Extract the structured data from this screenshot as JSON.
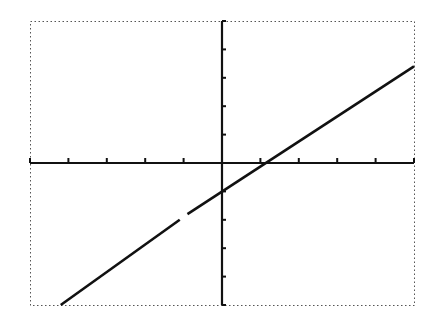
{
  "screen": {
    "type": "graphing-calculator-plot",
    "background": "#ffffff",
    "ink": "#111111",
    "border_style": "dotted"
  },
  "chart_data": {
    "type": "line",
    "title": "",
    "xlabel": "",
    "ylabel": "",
    "xlim": [
      -5,
      5
    ],
    "ylim": [
      -5,
      5
    ],
    "x_ticks": [
      -5,
      -4,
      -3,
      -2,
      -1,
      0,
      1,
      2,
      3,
      4,
      5
    ],
    "y_ticks": [
      -5,
      -4,
      -3,
      -2,
      -1,
      0,
      1,
      2,
      3,
      4,
      5
    ],
    "tick_labels_shown": false,
    "grid": false,
    "legend": null,
    "series": [
      {
        "name": "y = 0.9x - 1",
        "x": [
          -4.2,
          -1.1,
          -0.9,
          5
        ],
        "y": [
          -5,
          -2,
          -1.8,
          3.4
        ],
        "note": "straight line with slope ~0.9, y-intercept -1, x-intercept ~1; small pixel gap near x = -1"
      }
    ]
  }
}
